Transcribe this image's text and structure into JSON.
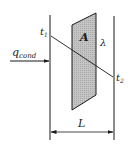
{
  "diagram": {
    "labels": {
      "heat_flow": "q",
      "heat_flow_sub": "cond",
      "temp_left": "t",
      "temp_left_sub": "1",
      "temp_right": "t",
      "temp_right_sub": "2",
      "area": "A",
      "conductivity": "λ",
      "thickness": "L"
    },
    "colors": {
      "line": "#1a1a1a",
      "area_fill": "#b8b8b8",
      "background": "#ffffff"
    }
  }
}
